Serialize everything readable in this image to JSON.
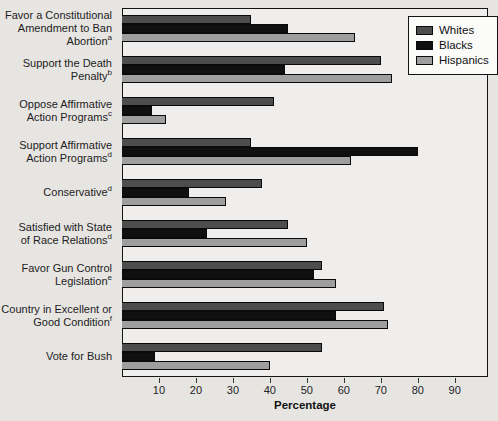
{
  "chart_data": {
    "type": "bar",
    "orientation": "horizontal",
    "title": "",
    "xlabel": "Percentage",
    "xlim": [
      0,
      99
    ],
    "xticks": [
      10,
      20,
      30,
      40,
      50,
      60,
      70,
      80,
      90
    ],
    "grid": false,
    "legend_position": "top-right",
    "categories": [
      {
        "lines": [
          "Favor a Constitutional",
          "Amendment to Ban",
          "Abortion"
        ],
        "sup": "a"
      },
      {
        "lines": [
          "Support the Death",
          "Penalty"
        ],
        "sup": "b"
      },
      {
        "lines": [
          "Oppose Affirmative",
          "Action Programs"
        ],
        "sup": "c"
      },
      {
        "lines": [
          "Support Affirmative",
          "Action Programs"
        ],
        "sup": "d"
      },
      {
        "lines": [
          "Conservative"
        ],
        "sup": "d"
      },
      {
        "lines": [
          "Satisfied with State",
          "of Race Relations"
        ],
        "sup": "d"
      },
      {
        "lines": [
          "Favor Gun Control",
          "Legislation"
        ],
        "sup": "e"
      },
      {
        "lines": [
          "Country in Excellent or",
          "Good Condition"
        ],
        "sup": "f"
      },
      {
        "lines": [
          "Vote for Bush"
        ],
        "sup": ""
      }
    ],
    "series": [
      {
        "name": "Whites",
        "color": "#4d4d4d",
        "values": [
          35,
          70,
          41,
          35,
          38,
          45,
          54,
          71,
          54
        ]
      },
      {
        "name": "Blacks",
        "color": "#101010",
        "values": [
          45,
          44,
          8,
          80,
          18,
          23,
          52,
          58,
          9
        ]
      },
      {
        "name": "Hispanics",
        "color": "#9e9e9e",
        "values": [
          63,
          73,
          12,
          62,
          28,
          50,
          58,
          72,
          40
        ]
      }
    ]
  }
}
